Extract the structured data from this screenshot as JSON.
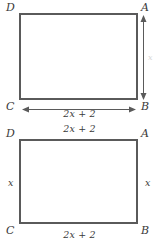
{
  "figures": [
    {
      "id": "top",
      "vertices": {
        "top_left": "D",
        "top_right": "A",
        "bottom_left": "C",
        "bottom_right": "B"
      },
      "dimensions": {
        "bottom": {
          "text": "2x + 2",
          "coef": "2",
          "var": "x",
          "op": "+",
          "const": "2"
        },
        "right": {
          "text": "x"
        }
      },
      "arrows": {
        "horizontal": "double-headed-arrow",
        "vertical": "double-headed-arrow"
      }
    },
    {
      "id": "bottom",
      "vertices": {
        "top_left": "D",
        "top_right": "A",
        "bottom_left": "C",
        "bottom_right": "B"
      },
      "dimensions": {
        "top": {
          "text": "2x + 2"
        },
        "bottom": {
          "text": "2x + 2"
        },
        "left": {
          "text": "x"
        },
        "right": {
          "text": "x"
        }
      }
    }
  ],
  "colors": {
    "stroke": "#5a5a5a",
    "text": "#3a3a3a",
    "faint_text": "#d8d8d8",
    "background": "#ffffff"
  }
}
